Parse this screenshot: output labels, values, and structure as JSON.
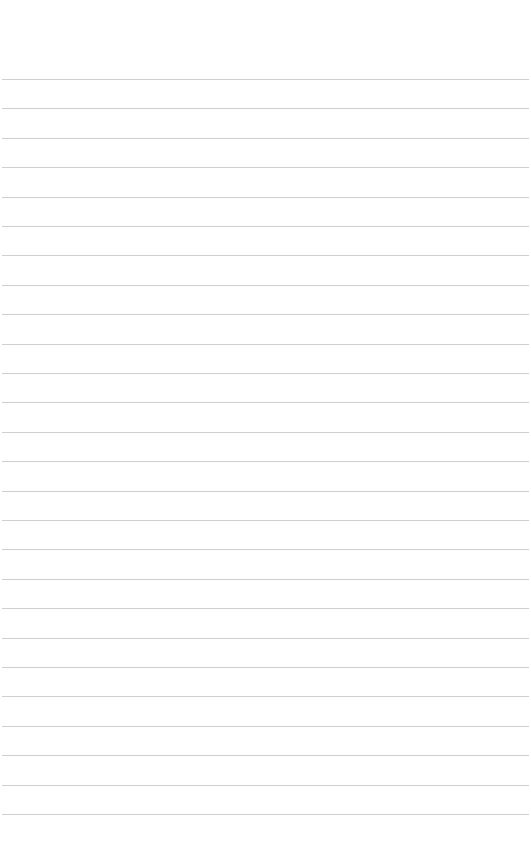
{
  "page": {
    "type": "lined-paper",
    "background": "#ffffff",
    "rule_color": "#cfcfcf",
    "rule_count": 26,
    "first_rule_y": 79,
    "rule_spacing": 29.4
  }
}
